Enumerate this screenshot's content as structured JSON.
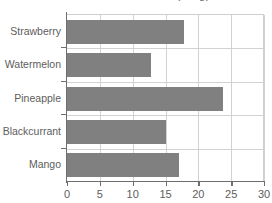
{
  "chart_data": {
    "type": "bar",
    "orientation": "horizontal",
    "title": "Fruit Smoothie Sales (in kg)",
    "xlabel": "",
    "ylabel": "",
    "categories": [
      "Strawberry",
      "Watermelon",
      "Pineapple",
      "Blackcurrant",
      "Mango"
    ],
    "values": [
      17.8,
      12.8,
      23.8,
      15.0,
      17.0
    ],
    "xlim": [
      0,
      30
    ],
    "xticks": [
      0,
      5,
      10,
      15,
      20,
      25,
      30
    ],
    "xtick_labels": [
      "0",
      "5",
      "10",
      "15",
      "20",
      "25",
      "30"
    ],
    "grid": "vertical-and-category-separators",
    "legend": "none",
    "bar_color": "#808080",
    "grid_color": "#d2d2d2",
    "axis_color": "#6e6e6e",
    "text_color": "#5d5d5d"
  },
  "axis": {
    "x": {
      "ticks": [
        {
          "label": "0",
          "value": 0
        },
        {
          "label": "5",
          "value": 5
        },
        {
          "label": "10",
          "value": 10
        },
        {
          "label": "15",
          "value": 15
        },
        {
          "label": "20",
          "value": 20
        },
        {
          "label": "25",
          "value": 25
        },
        {
          "label": "30",
          "value": 30
        }
      ]
    },
    "y": {
      "ticks": [
        {
          "label": "Strawberry"
        },
        {
          "label": "Watermelon"
        },
        {
          "label": "Pineapple"
        },
        {
          "label": "Blackcurrant"
        },
        {
          "label": "Mango"
        }
      ]
    }
  }
}
